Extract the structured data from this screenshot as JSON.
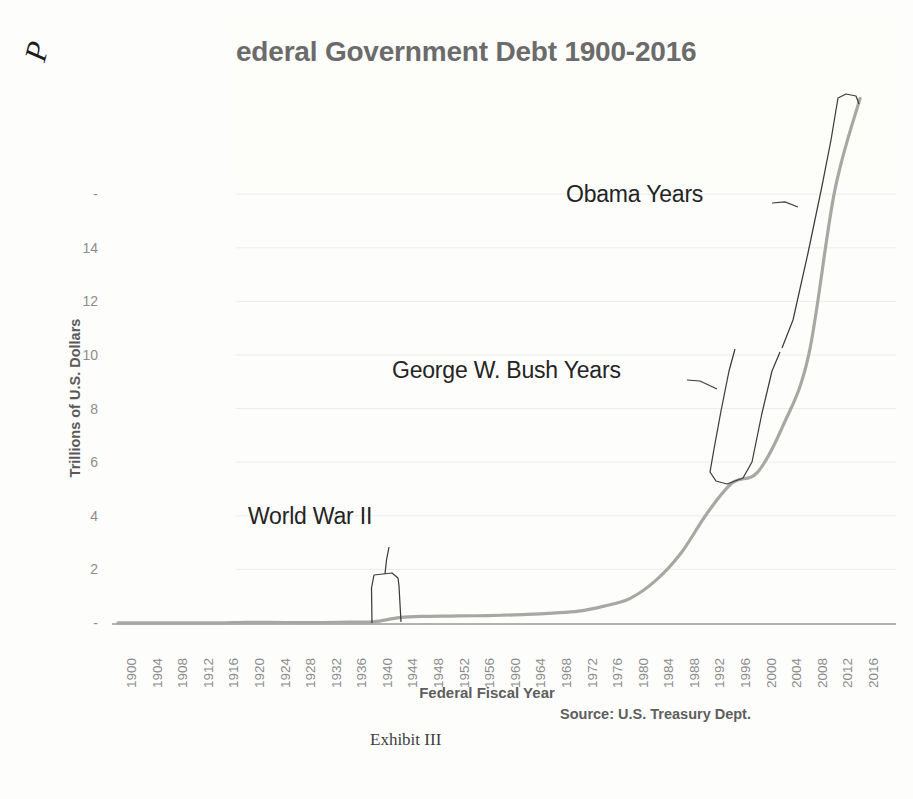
{
  "page": {
    "corner_mark": "P",
    "exhibit_caption": "Exhibit III"
  },
  "chart": {
    "title": "ederal Government Debt 1900-2016",
    "y_axis_title": "Trillions of U.S. Dollars",
    "x_axis_title": "Federal Fiscal Year",
    "source": "Source: U.S. Treasury Dept.",
    "annotations": [
      {
        "label": "World War II"
      },
      {
        "label": "George W. Bush Years"
      },
      {
        "label": "Obama Years"
      }
    ],
    "line_color": "#a8a8a2",
    "grid_color": "#ececec",
    "text_color": "#8b8b8b"
  },
  "chart_data": {
    "type": "line",
    "title": "ederal Government Debt 1900-2016",
    "xlabel": "Federal Fiscal Year",
    "ylabel": "Trillions of U.S. Dollars",
    "xlim": [
      1900,
      2016
    ],
    "ylim": [
      0,
      20
    ],
    "grid": true,
    "legend": "none",
    "y_ticks": [
      "-",
      "2",
      "4",
      "6",
      "8",
      "10",
      "12",
      "14",
      "-"
    ],
    "y_tick_values": [
      0,
      2,
      4,
      6,
      8,
      10,
      12,
      14,
      16
    ],
    "x_ticks": [
      "1900",
      "1904",
      "1908",
      "1912",
      "1916",
      "1920",
      "1924",
      "1928",
      "1932",
      "1936",
      "1940",
      "1944",
      "1948",
      "1952",
      "1956",
      "1960",
      "1964",
      "1968",
      "1972",
      "1976",
      "1980",
      "1984",
      "1988",
      "1992",
      "1996",
      "2000",
      "2004",
      "2008",
      "2012",
      "2016"
    ],
    "series": [
      {
        "name": "Federal Government Debt",
        "x": [
          1900,
          1904,
          1908,
          1912,
          1916,
          1920,
          1924,
          1928,
          1932,
          1936,
          1940,
          1944,
          1948,
          1952,
          1956,
          1960,
          1964,
          1968,
          1972,
          1976,
          1980,
          1984,
          1988,
          1992,
          1996,
          2000,
          2004,
          2008,
          2012,
          2016
        ],
        "values": [
          0.001,
          0.001,
          0.002,
          0.003,
          0.003,
          0.026,
          0.021,
          0.018,
          0.019,
          0.034,
          0.043,
          0.2,
          0.25,
          0.26,
          0.27,
          0.29,
          0.32,
          0.37,
          0.44,
          0.63,
          0.91,
          1.57,
          2.6,
          4.06,
          5.22,
          5.63,
          7.38,
          10.02,
          16.07,
          19.57
        ]
      }
    ],
    "annotations": [
      {
        "text": "World War II",
        "x_range": [
          1941,
          1945
        ],
        "y_value": 0.25
      },
      {
        "text": "George W. Bush Years",
        "x_range": [
          2001,
          2008
        ],
        "y_value": 7.0
      },
      {
        "text": "Obama Years",
        "x_range": [
          2009,
          2016
        ],
        "y_value": 15.0
      }
    ]
  }
}
